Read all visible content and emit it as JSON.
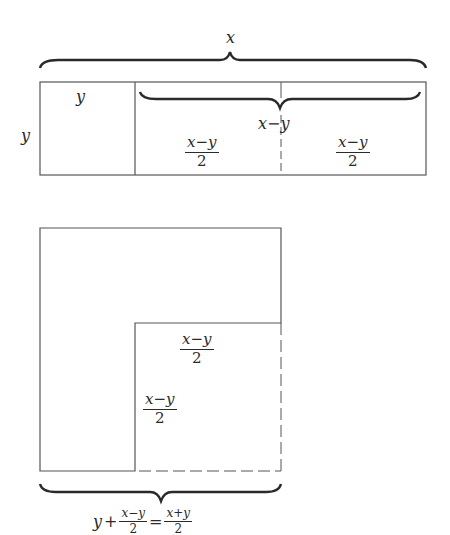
{
  "diagram": {
    "colors": {
      "line": "#555555",
      "text": "#2a2a2a",
      "background": "#ffffff"
    },
    "top_figure": {
      "brace_label_width": "x",
      "side_label_height": "y",
      "square_label": "y",
      "inner_brace_label": "x−y",
      "half_left": {
        "num": "x−y",
        "den": "2"
      },
      "half_right": {
        "num": "x−y",
        "den": "2"
      }
    },
    "bottom_figure": {
      "inner_top_label": {
        "num": "x−y",
        "den": "2"
      },
      "inner_side_label": {
        "num": "x−y",
        "den": "2"
      },
      "bottom_brace_equation": {
        "lhs_var": "y",
        "plus": "+",
        "frac1": {
          "num": "x−y",
          "den": "2"
        },
        "equals": "=",
        "frac2": {
          "num": "x+y",
          "den": "2"
        }
      }
    }
  }
}
